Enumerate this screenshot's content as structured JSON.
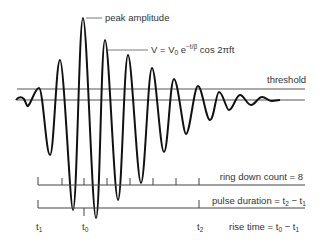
{
  "labels": {
    "peak_amplitude": "peak amplitude",
    "formula_main": "V = V",
    "formula_sub": "0",
    "formula_e": " e",
    "formula_exp": "−t/β",
    "formula_tail": " cos 2πft",
    "threshold": "threshold",
    "ring_down": "ring down count = 8",
    "pulse_duration": "pulse duration = t",
    "pulse_sub2": "2",
    "pulse_minus": " − t",
    "pulse_sub1": "1",
    "rise_time": "rise time = t",
    "rise_sub0": "0",
    "rise_minus": " − t",
    "rise_sub1": "1",
    "t1": "t",
    "t1_sub": "1",
    "t0": "t",
    "t0_sub": "0",
    "t2": "t",
    "t2_sub": "2"
  },
  "colors": {
    "waveform": "#111111",
    "lines": "#444444",
    "text": "#333333"
  }
}
